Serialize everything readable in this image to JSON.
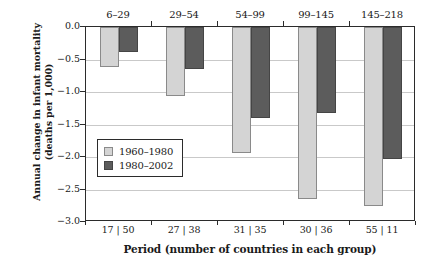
{
  "chart_data": {
    "type": "bar",
    "title": "",
    "xlabel": "Period (number of countries in each group)",
    "ylabel": "Annual change in infant mortality (deaths per 1,000)",
    "ylabel_line1": "Annual change in infant mortality",
    "ylabel_line2": "(deaths per 1,000)",
    "categories": [
      "6–29",
      "29–54",
      "54–99",
      "99–145",
      "145–218"
    ],
    "x_tick_labels": [
      "17 | 50",
      "27 | 38",
      "31 | 35",
      "30 | 36",
      "55 | 11"
    ],
    "series": [
      {
        "name": "1960–1980",
        "color": "#d4d4d4",
        "values": [
          -0.61,
          -1.06,
          -1.94,
          -2.64,
          -2.76
        ]
      },
      {
        "name": "1980–2002",
        "color": "#5c5c5c",
        "values": [
          -0.39,
          -0.65,
          -1.4,
          -1.32,
          -2.03
        ]
      }
    ],
    "ylim": [
      -3.0,
      0.0
    ],
    "y_ticks": [
      0.0,
      -0.5,
      -1.0,
      -1.5,
      -2.0,
      -2.5,
      -3.0
    ],
    "y_tick_labels": [
      "0.0",
      "−0.5",
      "−1.0",
      "−1.5",
      "−2.0",
      "−2.5",
      "−3.0"
    ],
    "grid": true,
    "legend_position": "center-left",
    "group_labels_position": "top"
  },
  "colors": {
    "series0": "#d4d4d4",
    "series1": "#5c5c5c",
    "axis": "#2b2b2b",
    "grid": "#c9c9c9",
    "background": "#ffffff"
  }
}
